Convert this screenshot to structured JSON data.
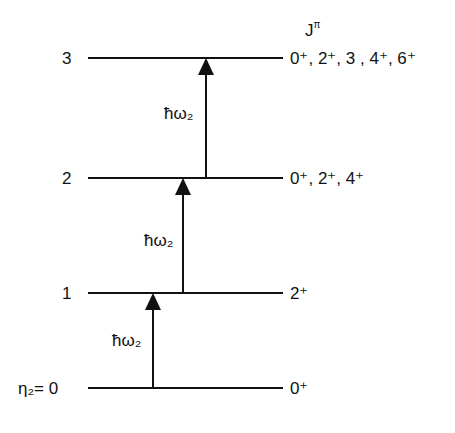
{
  "diagram": {
    "type": "energy-level-diagram",
    "header": {
      "symbol": "J",
      "superscript": "π"
    },
    "levels": [
      {
        "n_label": "3",
        "jpi": "0⁺, 2⁺, 3 , 4⁺, 6⁺"
      },
      {
        "n_label": "2",
        "jpi": "0⁺, 2⁺, 4⁺"
      },
      {
        "n_label": "1",
        "jpi": "2⁺"
      },
      {
        "n_label": "η₂= 0",
        "jpi": "0⁺"
      }
    ],
    "transitions": [
      {
        "label": "ħω₂",
        "from": "0",
        "to": "1"
      },
      {
        "label": "ħω₂",
        "from": "1",
        "to": "2"
      },
      {
        "label": "ħω₂",
        "from": "2",
        "to": "3"
      }
    ]
  }
}
